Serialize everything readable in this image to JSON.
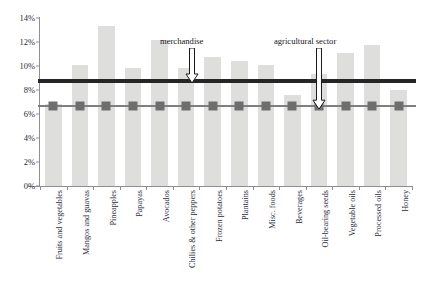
{
  "chart_data": {
    "type": "bar",
    "title": "",
    "xlabel": "",
    "ylabel": "",
    "ylim": [
      0,
      14
    ],
    "ytick_labels": [
      "0%",
      "2%",
      "4%",
      "6%",
      "8%",
      "10%",
      "12%",
      "14%"
    ],
    "ytick_values": [
      0,
      2,
      4,
      6,
      8,
      10,
      12,
      14
    ],
    "grid": false,
    "legend_position": "none",
    "categories": [
      "Fruits and vegetables",
      "Mangos and guavas",
      "Pineapples",
      "Papayas",
      "Avocados",
      "Chilies & other peppers",
      "Frozen potatoes",
      "Plantains",
      "Misc. foods",
      "Beverages",
      "Oil-bearing seeds",
      "Vegetable oils",
      "Processed oils",
      "Honey"
    ],
    "values": [
      6.8,
      10.1,
      13.3,
      9.8,
      12.2,
      9.8,
      10.75,
      10.45,
      10.1,
      7.6,
      9.35,
      11.1,
      11.75,
      8.0
    ],
    "bar_color": "#dededd",
    "reference_lines": [
      {
        "name": "merchandise",
        "value": 8.75,
        "color": "#262626",
        "style": "thick-solid"
      },
      {
        "name": "agricultural sector",
        "value": 6.65,
        "color": "#7f7f7f",
        "style": "line-with-square-markers"
      }
    ],
    "annotations": [
      {
        "label": "merchandise",
        "target": "merchandise",
        "arrow": "down"
      },
      {
        "label": "agricultural sector",
        "target": "agricultural sector",
        "arrow": "down"
      }
    ]
  }
}
